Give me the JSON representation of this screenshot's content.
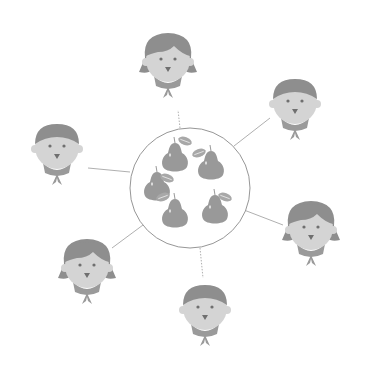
{
  "illustration": {
    "description": "Six people connected to a shared circle of pears",
    "colors": {
      "background": "#ffffff",
      "hair": "#8e8e8e",
      "skin": "#d4d4d4",
      "features": "#6f6f6f",
      "scarf": "#9a9a9a",
      "pear": "#999999",
      "leaf": "#a8a8a8",
      "circle_stroke": "#8a8a8a",
      "connector": "#9a9a9a"
    },
    "center": {
      "cx": 190,
      "cy": 188,
      "r": 60,
      "label": "pears"
    },
    "people": [
      {
        "id": "top",
        "type": "girl",
        "cx": 168,
        "cy": 60
      },
      {
        "id": "top-right",
        "type": "boy",
        "cx": 295,
        "cy": 102
      },
      {
        "id": "left",
        "type": "boy",
        "cx": 57,
        "cy": 147
      },
      {
        "id": "right",
        "type": "girl",
        "cx": 311,
        "cy": 228
      },
      {
        "id": "bottom-left",
        "type": "girl",
        "cx": 87,
        "cy": 266
      },
      {
        "id": "bottom",
        "type": "boy",
        "cx": 205,
        "cy": 308
      }
    ],
    "pears": [
      {
        "cx": 175,
        "cy": 157,
        "s": 1.0
      },
      {
        "cx": 211,
        "cy": 165,
        "s": 1.0
      },
      {
        "cx": 157,
        "cy": 186,
        "s": 1.0
      },
      {
        "cx": 175,
        "cy": 213,
        "s": 1.0
      },
      {
        "cx": 215,
        "cy": 209,
        "s": 1.0
      }
    ]
  }
}
